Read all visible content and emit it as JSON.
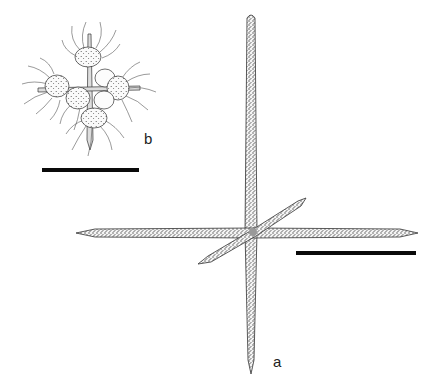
{
  "figure": {
    "panels": [
      {
        "id": "a",
        "label": "a",
        "subject": "isolated spicule cross (four long stippled spines meeting at a center, one diagonal shorter spine)",
        "scale_bar": {
          "x1": 296,
          "x2": 416,
          "y": 253
        }
      },
      {
        "id": "b",
        "label": "b",
        "subject": "whole cell with cross-shaped spines, rounded cell bodies bearing many curled filaments",
        "scale_bar": {
          "x1": 42,
          "x2": 139,
          "y": 170
        }
      }
    ],
    "colors": {
      "ink": "#1a1a1a",
      "stipple": "#555555",
      "background": "#ffffff"
    }
  }
}
